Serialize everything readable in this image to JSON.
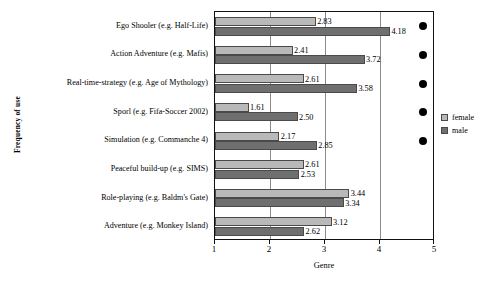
{
  "chart_data": {
    "type": "bar",
    "orientation": "horizontal",
    "title": "",
    "xlabel": "Genre",
    "ylabel": "Frequency of use",
    "xlim": [
      1,
      5
    ],
    "xticks": [
      "1",
      "2",
      "3",
      "4",
      "5"
    ],
    "grid": true,
    "legend_position": "right",
    "categories": [
      "Ego Shooler (e.g. Half-Life)",
      "Action Adventure (e.g. Mafis)",
      "Real-time-strategy (e.g. Age of Mythology)",
      "Sporl (e.g. Fifa-Soccer 2002)",
      "Simulation (e.g. Commanche 4)",
      "Peaceful build-up (e.g. SIMS)",
      "Role-playing (e.g. Baldm's Gate)",
      "Adventure (e.g. Monkey Island)"
    ],
    "series": [
      {
        "name": "female",
        "color": "#b9b9b9",
        "values": [
          2.83,
          2.41,
          2.61,
          1.61,
          2.17,
          2.61,
          3.44,
          3.12
        ],
        "labels": [
          "2.83",
          "2.41",
          "2.61",
          "1.61",
          "2.17",
          "2.61",
          "3.44",
          "3.12"
        ]
      },
      {
        "name": "male",
        "color": "#6f6f6f",
        "values": [
          4.18,
          3.72,
          3.58,
          2.5,
          2.85,
          2.53,
          3.34,
          2.62
        ],
        "labels": [
          "4.18",
          "3.72",
          "3.58",
          "2.50",
          "2.85",
          "2.53",
          "3.34",
          "2.62"
        ]
      }
    ],
    "significance_markers": {
      "symbol": "filled-circle",
      "color": "#000000",
      "categories": [
        "Ego Shooler (e.g. Half-Life)",
        "Action Adventure (e.g. Mafis)",
        "Real-time-strategy (e.g. Age of Mythology)",
        "Sporl (e.g. Fifa-Soccer 2002)",
        "Simulation (e.g. Commanche 4)"
      ],
      "at_value": 4.78
    }
  },
  "legend": {
    "entries": [
      {
        "label": "female",
        "swatch": "female"
      },
      {
        "label": "male",
        "swatch": "male"
      }
    ]
  }
}
